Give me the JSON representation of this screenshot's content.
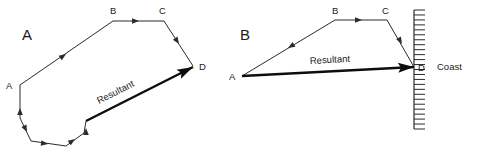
{
  "figure": {
    "background_color": "#ffffff",
    "stroke_color": "#2b2b2b",
    "resultant_color": "#0d0d0d",
    "width": 479,
    "height": 160
  },
  "panels": [
    {
      "id": "panel-a",
      "label": "A",
      "label_pos": {
        "x": 22,
        "y": 40
      },
      "vertex_labels": [
        {
          "name": "A",
          "text": "A",
          "x": 6,
          "y": 89
        },
        {
          "name": "B",
          "text": "B",
          "x": 110,
          "y": 14
        },
        {
          "name": "C",
          "text": "C",
          "x": 159,
          "y": 14
        },
        {
          "name": "D",
          "text": "D",
          "x": 199,
          "y": 70
        }
      ],
      "path_points": "20,85 113,21 164,21 193,66",
      "closed_path_points": "20,85 20,118 31,141 66,146 84,133 86,121",
      "leg_arrows": [
        {
          "name": "leg-arrow-ab",
          "x": 66,
          "y": 54,
          "angle": -34.5
        },
        {
          "name": "leg-arrow-bc",
          "x": 139,
          "y": 21,
          "angle": 0
        },
        {
          "name": "leg-arrow-cd",
          "x": 179,
          "y": 44,
          "angle": 57
        },
        {
          "name": "leg-arrow-a-down",
          "x": 20,
          "y": 108,
          "angle": -90
        },
        {
          "name": "leg-arrow-down-left",
          "x": 27,
          "y": 132,
          "angle": 64
        },
        {
          "name": "leg-arrow-bottom",
          "x": 48,
          "y": 144,
          "angle": 8
        },
        {
          "name": "leg-arrow-up-right",
          "x": 75,
          "y": 139,
          "angle": -35
        },
        {
          "name": "leg-arrow-up",
          "x": 86,
          "y": 128,
          "angle": -90
        }
      ],
      "resultant": {
        "label": "Resultant",
        "from": {
          "x": 86,
          "y": 121
        },
        "to": {
          "x": 193,
          "y": 67
        },
        "label_pos": {
          "x": 99,
          "y": 104
        },
        "label_angle": -26.8
      }
    },
    {
      "id": "panel-b",
      "label": "B",
      "label_pos": {
        "x": 240,
        "y": 40
      },
      "vertex_labels": [
        {
          "name": "A",
          "text": "A",
          "x": 229,
          "y": 80
        },
        {
          "name": "B",
          "text": "B",
          "x": 332,
          "y": 14
        },
        {
          "name": "C",
          "text": "C",
          "x": 382,
          "y": 14
        },
        {
          "name": "D",
          "text": "D",
          "x": 418,
          "y": 71
        }
      ],
      "path_points": "242,76 335,20 387,20 414,67",
      "leg_arrows": [
        {
          "name": "leg-arrow-ba",
          "x": 288,
          "y": 48,
          "angle": 149
        },
        {
          "name": "leg-arrow-bc",
          "x": 362,
          "y": 20,
          "angle": 0
        },
        {
          "name": "leg-arrow-cd",
          "x": 402,
          "y": 44,
          "angle": 60
        }
      ],
      "resultant": {
        "label": "Resultant",
        "from": {
          "x": 242,
          "y": 76
        },
        "to": {
          "x": 414,
          "y": 67
        },
        "label_pos": {
          "x": 310,
          "y": 64
        },
        "label_angle": -3
      },
      "coast": {
        "label": "Coast",
        "label_pos": {
          "x": 437,
          "y": 70
        },
        "line_x": 414,
        "line_top": 10,
        "line_bottom": 129,
        "hatch_length": 11,
        "hatch_count": 25
      }
    }
  ]
}
